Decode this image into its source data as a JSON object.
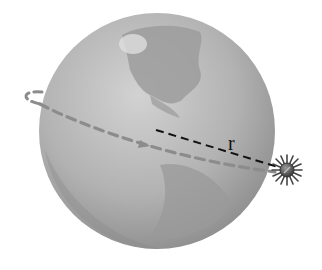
{
  "diagram": {
    "title": "",
    "labels": {
      "radius": "r"
    },
    "elements": {
      "planet": "Earth globe (Americas facing)",
      "orbit": "dashed elliptical orbit with direction arrow",
      "radius_line": "dashed line from Earth center to satellite",
      "satellite": "star-shaped satellite body"
    },
    "colors": {
      "globe_light": "#c8c8c8",
      "globe_dark": "#8a8a8a",
      "land": "#9a9a9a",
      "orbit": "#8c8c8c",
      "radius_line": "#111111",
      "satellite": "#555555"
    }
  }
}
